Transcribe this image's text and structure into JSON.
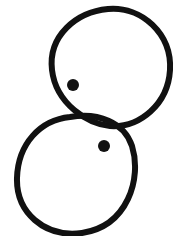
{
  "drawing": {
    "background": "#ffffff",
    "stroke_color": "#111111",
    "stroke_width": 6,
    "shapes": [
      {
        "type": "circle",
        "name": "upper-circle",
        "cx": 110,
        "cy": 66,
        "rx": 60,
        "ry": 60
      },
      {
        "type": "circle",
        "name": "lower-circle",
        "cx": 77,
        "cy": 176,
        "rx": 60,
        "ry": 59
      }
    ],
    "dots": [
      {
        "name": "upper-dot",
        "cx": 73,
        "cy": 85,
        "r": 6
      },
      {
        "name": "lower-dot",
        "cx": 104,
        "cy": 146,
        "r": 6
      }
    ]
  }
}
